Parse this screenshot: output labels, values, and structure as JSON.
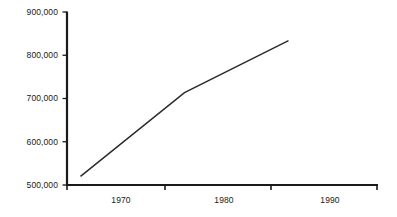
{
  "chart_data": {
    "type": "line",
    "title": "",
    "subtitle": "",
    "xlabel": "",
    "ylabel": "",
    "x": [
      1970,
      1980,
      1990
    ],
    "series": [
      {
        "name": "",
        "values": [
          520000,
          713000,
          833000
        ]
      }
    ],
    "xlim": [
      1968.7,
      1998.6
    ],
    "ylim": [
      500000,
      900000
    ],
    "yticks": [
      500000,
      600000,
      700000,
      800000,
      900000
    ],
    "ytick_labels": [
      "500,000",
      "600,000",
      "700,000",
      "800,000",
      "900,000"
    ],
    "xticks": [
      1970,
      1980,
      1990
    ],
    "xtick_labels": [
      "1970",
      "1980",
      "1990"
    ],
    "grid": false,
    "legend": false,
    "legend_position": "none",
    "annotations": []
  },
  "style": {
    "axis_color": "#1a1a1a",
    "line_color": "#2b2b2b",
    "label_color": "#1a1a1a",
    "background_color": "#ffffff"
  }
}
